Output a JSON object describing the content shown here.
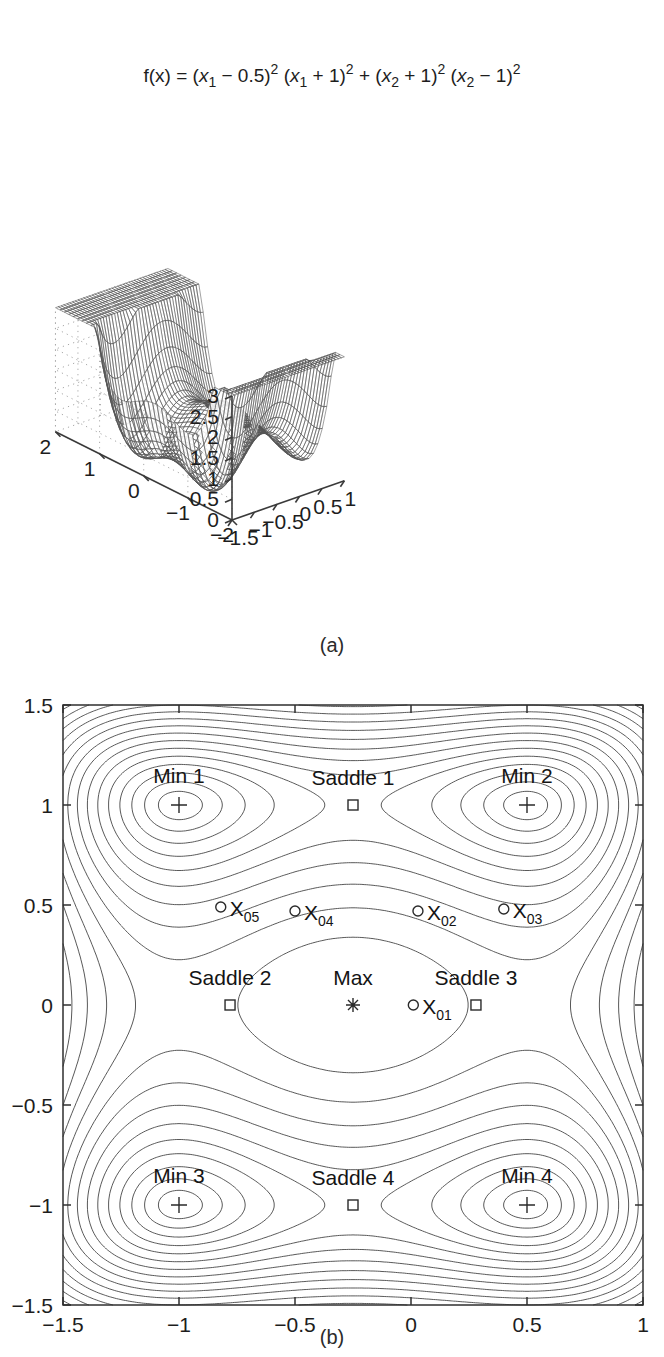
{
  "figure": {
    "panel_a": {
      "caption": "(a)",
      "title": "f(x) = (x1 − 0.5)2 (x1 + 1)2 + (x2 + 1)2 (x2 − 1)2",
      "title_parts": {
        "fx": "f(x) = (",
        "x1a": "x",
        "s1a": "1",
        "m05": " − 0.5)",
        "e1": "2",
        "p2": " (",
        "x1b": "x",
        "s1b": "1",
        "p1": " + 1)",
        "e2": "2",
        "plus": " + (",
        "x2a": "x",
        "s2a": "2",
        "p1b": " + 1)",
        "e3": "2",
        "p3": " (",
        "x2b": "x",
        "s2b": "2",
        "m1": " − 1)",
        "e4": "2"
      },
      "z_ticks": [
        "3",
        "2.5",
        "2",
        "1.5",
        "1",
        "0.5",
        "0"
      ],
      "x1_ticks": [
        "2",
        "1",
        "0",
        "−1",
        "−2"
      ],
      "x2_ticks": [
        "−1.5",
        "−1",
        "−0.5",
        "0",
        "0.5",
        "1"
      ]
    },
    "panel_b": {
      "caption": "(b)",
      "x_ticks": [
        "−1.5",
        "−1",
        "−0.5",
        "0",
        "0.5",
        "1"
      ],
      "y_ticks": [
        "1.5",
        "1",
        "0.5",
        "0",
        "−0.5",
        "−1",
        "−1.5"
      ],
      "points": [
        {
          "label": "Min 1",
          "marker": "plus",
          "x": -1.0,
          "y": 1.0,
          "label_dx": 0,
          "label_dy": -22,
          "anchor": "middle"
        },
        {
          "label": "Min 2",
          "marker": "plus",
          "x": 0.5,
          "y": 1.0,
          "label_dx": 0,
          "label_dy": -22,
          "anchor": "middle"
        },
        {
          "label": "Min 3",
          "marker": "plus",
          "x": -1.0,
          "y": -1.0,
          "label_dx": 0,
          "label_dy": -22,
          "anchor": "middle"
        },
        {
          "label": "Min 4",
          "marker": "plus",
          "x": 0.5,
          "y": -1.0,
          "label_dx": 0,
          "label_dy": -22,
          "anchor": "middle"
        },
        {
          "label": "Saddle 1",
          "marker": "square",
          "x": -0.25,
          "y": 1.0,
          "label_dx": 0,
          "label_dy": -20,
          "anchor": "middle"
        },
        {
          "label": "Saddle 2",
          "marker": "square",
          "x": -0.78,
          "y": 0.0,
          "label_dx": 0,
          "label_dy": -20,
          "anchor": "middle"
        },
        {
          "label": "Saddle 3",
          "marker": "square",
          "x": 0.28,
          "y": 0.0,
          "label_dx": 0,
          "label_dy": -20,
          "anchor": "middle"
        },
        {
          "label": "Saddle 4",
          "marker": "square",
          "x": -0.25,
          "y": -1.0,
          "label_dx": 0,
          "label_dy": -20,
          "anchor": "middle"
        },
        {
          "label": "Max",
          "marker": "star",
          "x": -0.25,
          "y": 0.0,
          "label_dx": 0,
          "label_dy": -20,
          "anchor": "middle"
        }
      ],
      "start_points": [
        {
          "label": "X",
          "sub": "01",
          "marker": "circle",
          "x": 0.01,
          "y": 0.0
        },
        {
          "label": "X",
          "sub": "02",
          "marker": "circle",
          "x": 0.03,
          "y": 0.47
        },
        {
          "label": "X",
          "sub": "03",
          "marker": "circle",
          "x": 0.4,
          "y": 0.48
        },
        {
          "label": "X",
          "sub": "04",
          "marker": "circle",
          "x": -0.5,
          "y": 0.47
        },
        {
          "label": "X",
          "sub": "05",
          "marker": "circle",
          "x": -0.82,
          "y": 0.49
        }
      ]
    }
  },
  "chart_data": [
    {
      "type": "surface",
      "title": "f(x) = (x1 − 0.5)^2 (x1 + 1)^2 + (x2 + 1)^2 (x2 − 1)^2",
      "function": "(x1-0.5)^2*(x1+1)^2 + (x2+1)^2*(x2-1)^2",
      "xlabel": "x1",
      "ylabel": "x2",
      "zlabel": "f(x)",
      "xlim": [
        -2,
        2
      ],
      "ylim": [
        -1.5,
        1
      ],
      "zlim": [
        0,
        3
      ],
      "x_ticks": [
        2,
        1,
        0,
        -1,
        -2
      ],
      "y_ticks": [
        -1.5,
        -1,
        -0.5,
        0,
        0.5,
        1
      ],
      "z_ticks": [
        0,
        0.5,
        1,
        1.5,
        2,
        2.5,
        3
      ],
      "grid": true,
      "legend": "none",
      "view": "3d-mesh"
    },
    {
      "type": "contour",
      "function": "(x1-0.5)^2*(x1+1)^2 + (x2+1)^2*(x2-1)^2",
      "xlabel": "x1",
      "ylabel": "x2",
      "xlim": [
        -1.5,
        1
      ],
      "ylim": [
        -1.5,
        1.5
      ],
      "x_ticks": [
        -1.5,
        -1,
        -0.5,
        0,
        0.5,
        1
      ],
      "y_ticks": [
        1.5,
        1,
        0.5,
        0,
        -0.5,
        -1,
        -1.5
      ],
      "grid": false,
      "legend": "none",
      "annotations": [
        {
          "text": "Min 1",
          "x": -1.0,
          "y": 1.0
        },
        {
          "text": "Min 2",
          "x": 0.5,
          "y": 1.0
        },
        {
          "text": "Min 3",
          "x": -1.0,
          "y": -1.0
        },
        {
          "text": "Min 4",
          "x": 0.5,
          "y": -1.0
        },
        {
          "text": "Saddle 1",
          "x": -0.25,
          "y": 1.0
        },
        {
          "text": "Saddle 2",
          "x": -0.78,
          "y": 0.0
        },
        {
          "text": "Saddle 3",
          "x": 0.28,
          "y": 0.0
        },
        {
          "text": "Saddle 4",
          "x": -0.25,
          "y": -1.0
        },
        {
          "text": "Max",
          "x": -0.25,
          "y": 0.0
        },
        {
          "text": "X01",
          "x": 0.01,
          "y": 0.0
        },
        {
          "text": "X02",
          "x": 0.03,
          "y": 0.47
        },
        {
          "text": "X03",
          "x": 0.4,
          "y": 0.48
        },
        {
          "text": "X04",
          "x": -0.5,
          "y": 0.47
        },
        {
          "text": "X05",
          "x": -0.82,
          "y": 0.49
        }
      ]
    }
  ]
}
